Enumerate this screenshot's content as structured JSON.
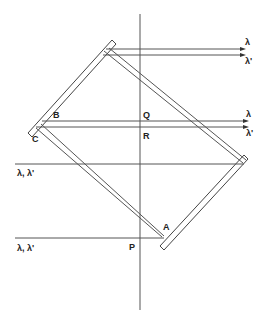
{
  "diagram": {
    "type": "optical-ray-diagram",
    "labels": {
      "A": "A",
      "B": "B",
      "C": "C",
      "P": "P",
      "Q": "Q",
      "R": "R"
    },
    "beams": {
      "top_out_1": "λ",
      "top_out_2": "λ'",
      "mid_out_1": "λ",
      "mid_out_2": "λ'",
      "input_upper": "λ, λ'",
      "input_lower": "λ, λ'"
    },
    "colors": {
      "line": "#555555",
      "text": "#222222",
      "background": "#ffffff"
    }
  }
}
